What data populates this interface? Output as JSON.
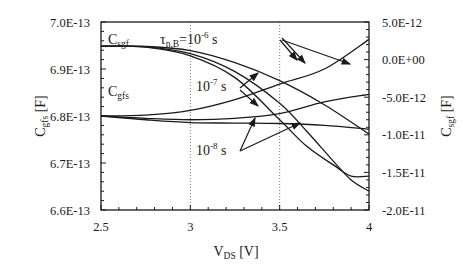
{
  "chart_data": {
    "type": "line",
    "title": "",
    "xlabel": {
      "main": "V",
      "sub": "DS",
      "unit": " [V]"
    },
    "ylabel_left": {
      "main": "C",
      "sub": "gfs",
      "unit": " [F]"
    },
    "ylabel_right": {
      "main": "C",
      "sub": "sgf",
      "unit": " [F]"
    },
    "xlim": [
      2.5,
      4
    ],
    "ylim_left": [
      6.6e-13,
      7e-13
    ],
    "ylim_right": [
      -2e-11,
      5e-12
    ],
    "x_ticks": [
      2.5,
      3,
      3.5,
      4
    ],
    "x_tick_labels": [
      "2.5",
      "3",
      "3.5",
      "4"
    ],
    "y_left_ticks": [
      7e-13,
      6.9e-13,
      6.8e-13,
      6.7e-13,
      6.6e-13
    ],
    "y_left_tick_labels": [
      "7.0E-13",
      "6.9E-13",
      "6.8E-13",
      "6.7E-13",
      "6.6E-13"
    ],
    "y_right_ticks": [
      5e-12,
      0.0,
      -5e-12,
      -1e-11,
      -1.5e-11,
      -2e-11
    ],
    "y_right_tick_labels": [
      "5.0E-12",
      "0.0E+00",
      "-5.0E-12",
      "-1.0E-11",
      "-1.5E-11",
      "-2.0E-11"
    ],
    "vertical_gridlines": [
      3,
      3.5
    ],
    "grid": "dotted vertical at 3 and 3.5",
    "series": [
      {
        "name": "Csgf tau=1e-6 s",
        "axis": "right",
        "x": [
          2.5,
          2.75,
          3.0,
          3.25,
          3.5,
          3.75,
          4.0
        ],
        "values": [
          1.8e-12,
          1.75e-12,
          1.2e-12,
          -4e-13,
          -2.8e-12,
          -6e-12,
          -9.9e-12
        ]
      },
      {
        "name": "Csgf tau=1e-7 s",
        "axis": "right",
        "x": [
          2.5,
          2.75,
          3.0,
          3.25,
          3.5,
          3.65,
          3.8,
          3.9,
          4.0
        ],
        "values": [
          1.8e-12,
          1.7e-12,
          8e-13,
          -1.6e-12,
          -5.8e-12,
          -9.5e-12,
          -1.35e-11,
          -1.6e-11,
          -1.75e-11
        ]
      },
      {
        "name": "Csgf tau=1e-8 s",
        "axis": "right",
        "x": [
          2.5,
          2.75,
          3.0,
          3.25,
          3.5,
          3.65,
          3.8,
          3.9,
          4.0
        ],
        "values": [
          1.8e-12,
          1.65e-12,
          5e-13,
          -2.4e-12,
          -8e-12,
          -1.15e-11,
          -1.4e-11,
          -1.55e-11,
          -1.55e-11
        ]
      },
      {
        "name": "Cgfs tau=1e-6 s",
        "axis": "left",
        "x": [
          2.5,
          2.75,
          3.0,
          3.25,
          3.5,
          3.75,
          4.0
        ],
        "values": [
          6.8e-13,
          6.802e-13,
          6.812e-13,
          6.835e-13,
          6.868e-13,
          6.9e-13,
          6.963e-13
        ]
      },
      {
        "name": "Cgfs tau=1e-7 s",
        "axis": "left",
        "x": [
          2.5,
          2.75,
          3.0,
          3.25,
          3.5,
          3.75,
          4.0
        ],
        "values": [
          6.8e-13,
          6.795e-13,
          6.792e-13,
          6.795e-13,
          6.805e-13,
          6.83e-13,
          6.846e-13
        ]
      },
      {
        "name": "Cgfs tau=1e-8 s",
        "axis": "left",
        "x": [
          2.5,
          2.75,
          3.0,
          3.25,
          3.5,
          3.75,
          4.0
        ],
        "values": [
          6.8e-13,
          6.792e-13,
          6.786e-13,
          6.785e-13,
          6.784e-13,
          6.78e-13,
          6.772e-13
        ]
      }
    ],
    "annotations": [
      {
        "id": "csgf",
        "main": "C",
        "sub": "sgf"
      },
      {
        "id": "cgfs",
        "main": "C",
        "sub": "gfs"
      },
      {
        "id": "tau6",
        "main": "τ",
        "sub": "n,B",
        "eq": "=10",
        "sup": "-6",
        "unit": " s"
      },
      {
        "id": "tau7",
        "main": "10",
        "sup": "-7",
        "unit": " s"
      },
      {
        "id": "tau8",
        "main": "10",
        "sup": "-8",
        "unit": " s"
      }
    ]
  }
}
